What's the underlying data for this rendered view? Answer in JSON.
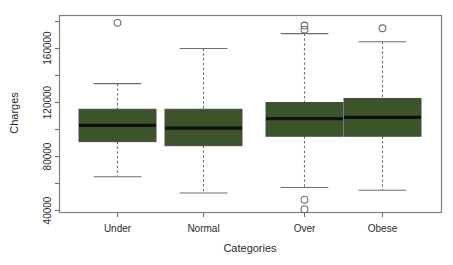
{
  "chart_data": {
    "type": "box",
    "title": "",
    "xlabel": "Categories",
    "ylabel": "Charges",
    "categories": [
      "Under",
      "Normal",
      "Over",
      "Obese"
    ],
    "ylim": [
      34000,
      183000
    ],
    "yticks_major": [
      40000,
      80000,
      120000,
      160000
    ],
    "ytick_labels": [
      "40000",
      "80000",
      "120000",
      "160000"
    ],
    "yticks_minor": [
      60000,
      100000,
      140000,
      180000
    ],
    "grid": false,
    "legend": null,
    "box_fill_color": "#3c5429",
    "box_edge_color": "#4a4a4a",
    "median_color": "#111111",
    "whisker_color": "#6e6e6e",
    "boxes": [
      {
        "category": "Under",
        "whisker_low": 65000,
        "q1": 91000,
        "median": 103000,
        "q3": 115000,
        "whisker_high": 134000,
        "outliers": [
          179000
        ]
      },
      {
        "category": "Normal",
        "whisker_low": 53000,
        "q1": 88000,
        "median": 101000,
        "q3": 115000,
        "whisker_high": 160000,
        "outliers": []
      },
      {
        "category": "Over",
        "whisker_low": 57000,
        "q1": 95000,
        "median": 108000,
        "q3": 120000,
        "whisker_high": 171000,
        "outliers": [
          177000,
          174000,
          48000,
          41000
        ]
      },
      {
        "category": "Obese",
        "whisker_low": 55000,
        "q1": 95000,
        "median": 109000,
        "q3": 123000,
        "whisker_high": 165000,
        "outliers": [
          175000
        ]
      }
    ]
  },
  "axes": {
    "y_title": "Charges",
    "x_title": "Categories",
    "y_labels": [
      "160000",
      "120000",
      "80000",
      "40000"
    ],
    "x_labels": [
      "Under",
      "Normal",
      "Over",
      "Obese"
    ]
  }
}
